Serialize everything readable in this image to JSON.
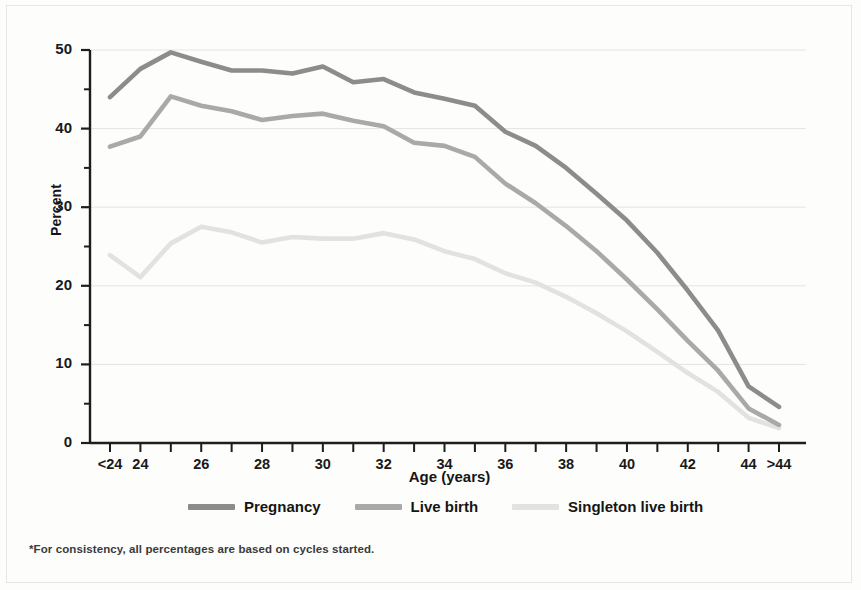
{
  "chart_data": {
    "type": "line",
    "title": "",
    "xlabel": "Age (years)",
    "ylabel": "Percent",
    "ylim": [
      0,
      50
    ],
    "yticks": [
      0,
      10,
      20,
      30,
      40,
      50
    ],
    "yminorticks": [
      5,
      15,
      25,
      35,
      45
    ],
    "grid": "horizontal-major",
    "legend_position": "bottom",
    "categories": [
      "<24",
      "24",
      "25",
      "26",
      "27",
      "28",
      "29",
      "30",
      "31",
      "32",
      "33",
      "34",
      "35",
      "36",
      "37",
      "38",
      "39",
      "40",
      "41",
      "42",
      "43",
      "44",
      ">44"
    ],
    "xtick_labels": [
      "<24",
      "24",
      "",
      "26",
      "",
      "28",
      "",
      "30",
      "",
      "32",
      "",
      "34",
      "",
      "36",
      "",
      "38",
      "",
      "40",
      "",
      "42",
      "",
      "44",
      ">44"
    ],
    "series": [
      {
        "name": "Pregnancy",
        "color": "#8c8c8c",
        "values": [
          44.0,
          47.6,
          49.7,
          48.5,
          47.4,
          47.4,
          47.0,
          47.9,
          45.9,
          46.3,
          44.6,
          43.8,
          42.9,
          39.6,
          37.8,
          35.0,
          31.7,
          28.3,
          24.2,
          19.4,
          14.3,
          7.2,
          4.6
        ]
      },
      {
        "name": "Live birth",
        "color": "#a9a9a9",
        "values": [
          37.7,
          39.0,
          44.1,
          42.9,
          42.2,
          41.1,
          41.6,
          41.9,
          41.0,
          40.3,
          38.2,
          37.8,
          36.4,
          33.0,
          30.5,
          27.6,
          24.4,
          20.8,
          17.0,
          13.0,
          9.2,
          4.4,
          2.3
        ]
      },
      {
        "name": "Singleton live birth",
        "color": "#e2e2e2",
        "values": [
          23.9,
          21.1,
          25.4,
          27.5,
          26.8,
          25.5,
          26.2,
          26.0,
          26.0,
          26.7,
          25.9,
          24.4,
          23.4,
          21.6,
          20.4,
          18.6,
          16.5,
          14.2,
          11.6,
          8.9,
          6.5,
          3.2,
          1.9
        ]
      }
    ]
  },
  "axis": {
    "ylabel": "Percent",
    "xlabel": "Age (years)"
  },
  "legend": {
    "items": [
      {
        "label": "Pregnancy",
        "color": "#8c8c8c"
      },
      {
        "label": "Live birth",
        "color": "#a9a9a9"
      },
      {
        "label": "Singleton live birth",
        "color": "#e2e2e2"
      }
    ]
  },
  "footnote": {
    "text": "*For consistency, all percentages are based on cycles started."
  }
}
